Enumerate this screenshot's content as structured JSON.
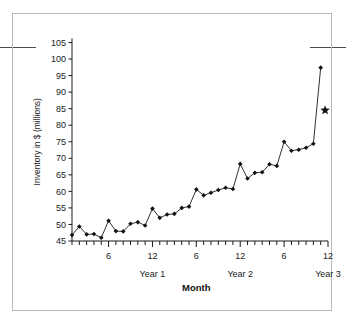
{
  "chart_data": {
    "type": "line",
    "title": "",
    "xlabel": "Month",
    "ylabel": "Inventory in $ (millions)",
    "ylim": [
      45,
      105
    ],
    "ytick_step": 5,
    "yticks": [
      45,
      50,
      55,
      60,
      65,
      70,
      75,
      80,
      85,
      90,
      95,
      100,
      105
    ],
    "xlim": [
      1,
      36
    ],
    "xticks_labeled": [
      6,
      12,
      18,
      24,
      30,
      36
    ],
    "xtick_labels": [
      "6",
      "12",
      "6",
      "12",
      "6",
      "12"
    ],
    "xtick_all_step": 1,
    "grid": false,
    "legend": null,
    "group_labels": [
      {
        "label": "Year 1",
        "x": 12
      },
      {
        "label": "Year 2",
        "x": 24
      },
      {
        "label": "Year 3",
        "x": 36
      }
    ],
    "x": [
      1,
      2,
      3,
      4,
      5,
      6,
      7,
      8,
      9,
      10,
      11,
      12,
      13,
      14,
      15,
      16,
      17,
      18,
      19,
      20,
      21,
      22,
      23,
      24,
      25,
      26,
      27,
      28,
      29,
      30,
      31,
      32,
      33,
      34,
      35
    ],
    "series": [
      {
        "name": "Inventory",
        "marker": "diamond",
        "color": "#111111",
        "values": [
          46.8,
          49.4,
          47.0,
          47.1,
          46.0,
          51.1,
          48.0,
          47.9,
          50.2,
          50.7,
          49.7,
          54.8,
          52.0,
          53.0,
          53.2,
          55.0,
          55.4,
          60.6,
          58.8,
          59.6,
          60.4,
          61.1,
          60.7,
          68.3,
          63.9,
          65.6,
          65.8,
          68.2,
          67.7,
          75.0,
          72.3,
          72.6,
          73.2,
          74.4,
          97.4
        ]
      }
    ],
    "annotation_points": [
      {
        "name": "forecast-star",
        "marker": "star",
        "x": 35.6,
        "y": 84.5,
        "color": "#111111"
      }
    ]
  },
  "decor": {
    "left_rule": "horizontal-rule",
    "right_rule": "horizontal-rule",
    "frame": "figure-border"
  }
}
